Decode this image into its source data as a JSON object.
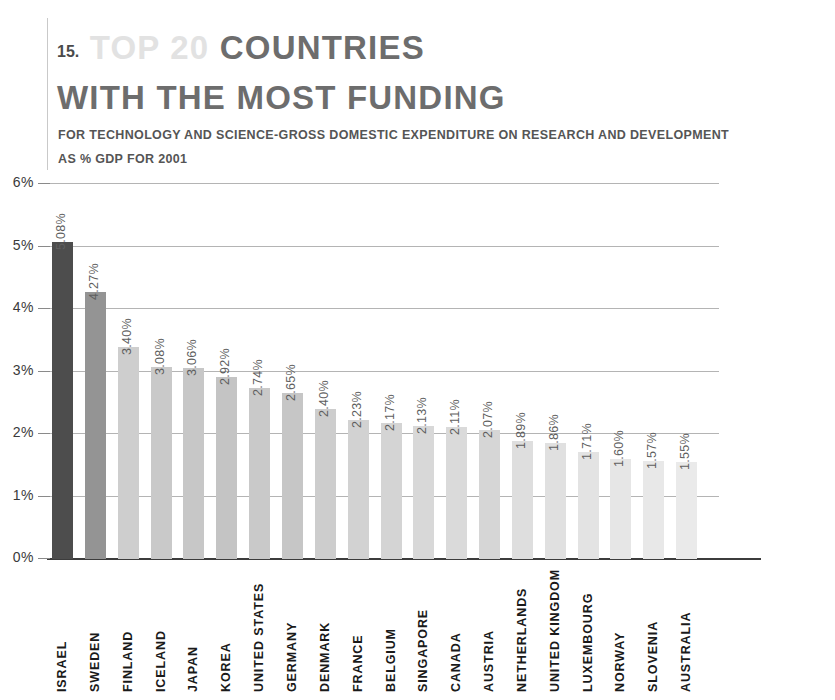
{
  "header": {
    "number": "15.",
    "title_ghost": "TOP 20",
    "title_solid": "COUNTRIES",
    "title_line2": "WITH THE MOST FUNDING",
    "subtitle_line1": "FOR TECHNOLOGY AND SCIENCE-GROSS DOMESTIC EXPENDITURE ON RESEARCH AND DEVELOPMENT",
    "subtitle_line2": "AS % GDP FOR 2001"
  },
  "colors": {
    "highlight_bar": "#4d4d4d",
    "second_bar": "#8f8f8f",
    "light_bar": "#e8e8e8",
    "axis": "#3c3c3c",
    "grid": "#b4b4b4",
    "title_ghost": "#e2e2e2",
    "title_solid": "#6d6d6d"
  },
  "chart_data": {
    "type": "bar",
    "title": "TOP 20 COUNTRIES WITH THE MOST FUNDING",
    "subtitle": "FOR TECHNOLOGY AND SCIENCE-GROSS DOMESTIC EXPENDITURE ON RESEARCH AND DEVELOPMENT AS % GDP FOR 2001",
    "xlabel": "",
    "ylabel": "",
    "ylim": [
      0,
      6
    ],
    "ytick_labels": [
      "6%",
      "5%",
      "4%",
      "3%",
      "2%",
      "1%",
      "0%"
    ],
    "ytick_values": [
      6,
      5,
      4,
      3,
      2,
      1,
      0
    ],
    "grid": true,
    "legend": "none",
    "categories": [
      "ISRAEL",
      "SWEDEN",
      "FINLAND",
      "ICELAND",
      "JAPAN",
      "KOREA",
      "UNITED STATES",
      "GERMANY",
      "DENMARK",
      "FRANCE",
      "BELGIUM",
      "SINGAPORE",
      "CANADA",
      "AUSTRIA",
      "NETHERLANDS",
      "UNITED KINGDOM",
      "LUXEMBOURG",
      "NORWAY",
      "SLOVENIA",
      "AUSTRALIA"
    ],
    "values": [
      5.08,
      4.27,
      3.4,
      3.08,
      3.06,
      2.92,
      2.74,
      2.65,
      2.4,
      2.23,
      2.17,
      2.13,
      2.11,
      2.07,
      1.89,
      1.86,
      1.71,
      1.6,
      1.57,
      1.55
    ],
    "value_labels": [
      "5.08%",
      "4.27%",
      "3.40%",
      "3.08%",
      "3.06%",
      "2.92%",
      "2.74%",
      "2.65%",
      "2.40%",
      "2.23%",
      "2.17%",
      "2.13%",
      "2.11%",
      "2.07%",
      "1.89%",
      "1.86%",
      "1.71%",
      "1.60%",
      "1.57%",
      "1.55%"
    ],
    "bar_colors": [
      "#4d4d4d",
      "#949494",
      "#cecece",
      "#c9c9c9",
      "#c7c7c7",
      "#c4c4c4",
      "#c9c9c9",
      "#c6c6c6",
      "#cdcdcd",
      "#d2d2d2",
      "#d4d4d4",
      "#d8d8d8",
      "#dadada",
      "#d6d6d6",
      "#dedede",
      "#e0e0e0",
      "#e3e3e3",
      "#e6e6e6",
      "#e8e8e8",
      "#eaeaea"
    ]
  }
}
